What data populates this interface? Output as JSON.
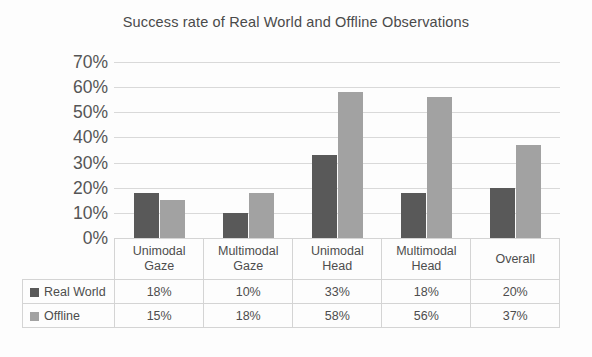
{
  "chart_data": {
    "type": "bar",
    "title": "Success rate of Real World and Offline Observations",
    "xlabel": "",
    "ylabel": "",
    "ylim": [
      0,
      70
    ],
    "ytick_labels": [
      "70%",
      "60%",
      "50%",
      "40%",
      "30%",
      "20%",
      "10%",
      "0%"
    ],
    "ytick_values": [
      70,
      60,
      50,
      40,
      30,
      20,
      10,
      0
    ],
    "grid": true,
    "legend_position": "data-table-left",
    "categories": [
      "Unimodal Gaze",
      "Multimodal Gaze",
      "Unimodal Head",
      "Multimodal Head",
      "Overall"
    ],
    "category_lines": [
      [
        "Unimodal",
        "Gaze"
      ],
      [
        "Multimodal",
        "Gaze"
      ],
      [
        "Unimodal",
        "Head"
      ],
      [
        "Multimodal",
        "Head"
      ],
      [
        "Overall",
        ""
      ]
    ],
    "series": [
      {
        "name": "Real World",
        "color": "#595959",
        "values": [
          18,
          10,
          33,
          18,
          20
        ],
        "labels": [
          "18%",
          "10%",
          "33%",
          "18%",
          "20%"
        ]
      },
      {
        "name": "Offline",
        "color": "#a2a2a2",
        "values": [
          15,
          18,
          58,
          56,
          37
        ],
        "labels": [
          "15%",
          "18%",
          "58%",
          "56%",
          "37%"
        ]
      }
    ]
  },
  "table": {
    "corner_label": "",
    "column_headers": [
      "Unimodal Gaze",
      "Multimodal Gaze",
      "Unimodal Head",
      "Multimodal Head",
      "Overall"
    ],
    "rows": [
      {
        "label": "Real World",
        "values": [
          "18%",
          "10%",
          "33%",
          "18%",
          "20%"
        ]
      },
      {
        "label": "Offline",
        "values": [
          "15%",
          "18%",
          "58%",
          "56%",
          "37%"
        ]
      }
    ]
  }
}
